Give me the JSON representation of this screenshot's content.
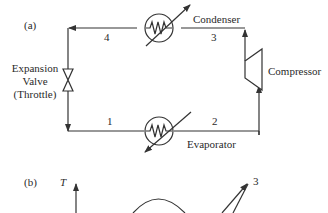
{
  "figure": {
    "panel_a": {
      "label": "(a)",
      "components": {
        "condenser": "Condenser",
        "compressor": "Compressor",
        "evaporator": "Evaporator",
        "expansion_valve_line1": "Expansion",
        "expansion_valve_line2": "Valve",
        "expansion_valve_line3": "(Throttle)"
      },
      "state_points": [
        "1",
        "2",
        "3",
        "4"
      ]
    },
    "panel_b": {
      "label": "(b)",
      "y_axis_label": "T",
      "state_points": [
        "3"
      ]
    },
    "colors": {
      "line": "#333333",
      "background": "#ffffff"
    }
  }
}
